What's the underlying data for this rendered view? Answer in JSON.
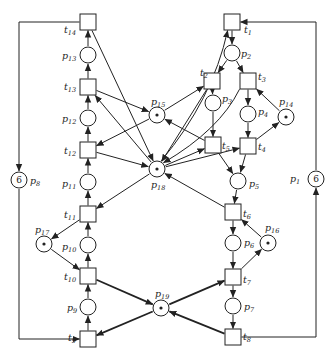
{
  "diagram": {
    "type": "petri-net",
    "colors": {
      "stroke": "#222222",
      "background": "#ffffff"
    },
    "places": [
      {
        "id": "p1",
        "label": "p",
        "sub": "1",
        "x": 316,
        "y": 179,
        "tokens": "6",
        "lx": 290,
        "ly": 182
      },
      {
        "id": "p2",
        "label": "p",
        "sub": "2",
        "x": 232,
        "y": 53,
        "tokens": "",
        "lx": 241,
        "ly": 57
      },
      {
        "id": "p3",
        "label": "p",
        "sub": "3",
        "x": 213,
        "y": 103,
        "tokens": "",
        "lx": 222,
        "ly": 102
      },
      {
        "id": "p4",
        "label": "p",
        "sub": "4",
        "x": 248,
        "y": 114,
        "tokens": "",
        "lx": 258,
        "ly": 115
      },
      {
        "id": "p5",
        "label": "p",
        "sub": "5",
        "x": 238,
        "y": 181,
        "tokens": "",
        "lx": 249,
        "ly": 187
      },
      {
        "id": "p6",
        "label": "p",
        "sub": "6",
        "x": 233,
        "y": 243,
        "tokens": "",
        "lx": 244,
        "ly": 246
      },
      {
        "id": "p7",
        "label": "p",
        "sub": "7",
        "x": 233,
        "y": 306,
        "tokens": "",
        "lx": 244,
        "ly": 310
      },
      {
        "id": "p8",
        "label": "p",
        "sub": "8",
        "x": 19,
        "y": 180,
        "tokens": "6",
        "lx": 30,
        "ly": 184
      },
      {
        "id": "p9",
        "label": "p",
        "sub": "9",
        "x": 88,
        "y": 307,
        "tokens": "",
        "lx": 67,
        "ly": 311
      },
      {
        "id": "p10",
        "label": "p",
        "sub": "10",
        "x": 88,
        "y": 245,
        "tokens": "",
        "lx": 62,
        "ly": 250
      },
      {
        "id": "p11",
        "label": "p",
        "sub": "11",
        "x": 88,
        "y": 182,
        "tokens": "",
        "lx": 62,
        "ly": 187
      },
      {
        "id": "p12",
        "label": "p",
        "sub": "12",
        "x": 88,
        "y": 118,
        "tokens": "",
        "lx": 62,
        "ly": 122
      },
      {
        "id": "p13",
        "label": "p",
        "sub": "13",
        "x": 88,
        "y": 55,
        "tokens": "",
        "lx": 62,
        "ly": 59
      },
      {
        "id": "p14",
        "label": "p",
        "sub": "14",
        "x": 286,
        "y": 117,
        "tokens": "•",
        "lx": 279,
        "ly": 105
      },
      {
        "id": "p15",
        "label": "p",
        "sub": "15",
        "x": 157,
        "y": 115,
        "tokens": "•",
        "lx": 151,
        "ly": 105
      },
      {
        "id": "p16",
        "label": "p",
        "sub": "16",
        "x": 268,
        "y": 243,
        "tokens": "•",
        "lx": 265,
        "ly": 231
      },
      {
        "id": "p17",
        "label": "p",
        "sub": "17",
        "x": 44,
        "y": 244,
        "tokens": "•",
        "lx": 35,
        "ly": 233
      },
      {
        "id": "p18",
        "label": "p",
        "sub": "18",
        "x": 157,
        "y": 169,
        "tokens": "•",
        "lx": 151,
        "ly": 188
      },
      {
        "id": "p19",
        "label": "p",
        "sub": "19",
        "x": 161,
        "y": 308,
        "tokens": "•",
        "lx": 155,
        "ly": 297
      }
    ],
    "transitions": [
      {
        "id": "t1",
        "label": "t",
        "sub": "1",
        "x": 232,
        "y": 22,
        "lx": 244,
        "ly": 33
      },
      {
        "id": "t2",
        "label": "t",
        "sub": "2",
        "x": 212,
        "y": 81,
        "lx": 200,
        "ly": 76
      },
      {
        "id": "t3",
        "label": "t",
        "sub": "3",
        "x": 248,
        "y": 81,
        "lx": 258,
        "ly": 80
      },
      {
        "id": "t4",
        "label": "t",
        "sub": "4",
        "x": 248,
        "y": 146,
        "lx": 258,
        "ly": 150
      },
      {
        "id": "t5",
        "label": "t",
        "sub": "5",
        "x": 213,
        "y": 145,
        "lx": 222,
        "ly": 149
      },
      {
        "id": "t6",
        "label": "t",
        "sub": "6",
        "x": 233,
        "y": 212,
        "lx": 243,
        "ly": 217
      },
      {
        "id": "t7",
        "label": "t",
        "sub": "7",
        "x": 233,
        "y": 277,
        "lx": 243,
        "ly": 283
      },
      {
        "id": "t8",
        "label": "t",
        "sub": "8",
        "x": 233,
        "y": 337,
        "lx": 243,
        "ly": 340
      },
      {
        "id": "t9",
        "label": "t",
        "sub": "9",
        "x": 88,
        "y": 339,
        "lx": 68,
        "ly": 341
      },
      {
        "id": "t10",
        "label": "t",
        "sub": "10",
        "x": 88,
        "y": 276,
        "lx": 64,
        "ly": 280
      },
      {
        "id": "t11",
        "label": "t",
        "sub": "11",
        "x": 88,
        "y": 214,
        "lx": 64,
        "ly": 218
      },
      {
        "id": "t12",
        "label": "t",
        "sub": "12",
        "x": 88,
        "y": 150,
        "lx": 64,
        "ly": 154
      },
      {
        "id": "t13",
        "label": "t",
        "sub": "13",
        "x": 88,
        "y": 87,
        "lx": 64,
        "ly": 90
      },
      {
        "id": "t14",
        "label": "t",
        "sub": "14",
        "x": 88,
        "y": 22,
        "lx": 64,
        "ly": 33
      }
    ],
    "arcs": [
      {
        "from": "t1",
        "to": "p2",
        "points": [
          [
            232,
            22
          ],
          [
            232,
            53
          ]
        ]
      },
      {
        "from": "p2",
        "to": "t2",
        "points": [
          [
            232,
            53
          ],
          [
            212,
            81
          ]
        ]
      },
      {
        "from": "p2",
        "to": "t3",
        "points": [
          [
            232,
            53
          ],
          [
            248,
            81
          ]
        ]
      },
      {
        "from": "t2",
        "to": "p3",
        "points": [
          [
            212,
            81
          ],
          [
            213,
            103
          ]
        ]
      },
      {
        "from": "t3",
        "to": "p4",
        "points": [
          [
            248,
            81
          ],
          [
            248,
            114
          ]
        ]
      },
      {
        "from": "p14",
        "to": "t3",
        "points": [
          [
            286,
            117
          ],
          [
            248,
            81
          ]
        ]
      },
      {
        "from": "p3",
        "to": "t5",
        "points": [
          [
            213,
            103
          ],
          [
            213,
            145
          ]
        ]
      },
      {
        "from": "p4",
        "to": "t4",
        "points": [
          [
            248,
            114
          ],
          [
            248,
            146
          ]
        ]
      },
      {
        "from": "t4",
        "to": "p14",
        "points": [
          [
            248,
            146
          ],
          [
            286,
            117
          ]
        ]
      },
      {
        "from": "t5",
        "to": "p5",
        "points": [
          [
            213,
            145
          ],
          [
            238,
            181
          ]
        ]
      },
      {
        "from": "t4",
        "to": "p5",
        "points": [
          [
            248,
            146
          ],
          [
            238,
            181
          ]
        ]
      },
      {
        "from": "p5",
        "to": "t6",
        "points": [
          [
            238,
            181
          ],
          [
            233,
            212
          ]
        ]
      },
      {
        "from": "t6",
        "to": "p6",
        "points": [
          [
            233,
            212
          ],
          [
            233,
            243
          ]
        ]
      },
      {
        "from": "p16",
        "to": "t6",
        "points": [
          [
            268,
            243
          ],
          [
            233,
            212
          ]
        ]
      },
      {
        "from": "p6",
        "to": "t7",
        "points": [
          [
            233,
            243
          ],
          [
            233,
            277
          ]
        ]
      },
      {
        "from": "t7",
        "to": "p16",
        "points": [
          [
            233,
            277
          ],
          [
            268,
            243
          ]
        ]
      },
      {
        "from": "t7",
        "to": "p7",
        "points": [
          [
            233,
            277
          ],
          [
            233,
            306
          ]
        ]
      },
      {
        "from": "p7",
        "to": "t8",
        "points": [
          [
            233,
            306
          ],
          [
            233,
            337
          ]
        ]
      },
      {
        "from": "t8",
        "to": "p1",
        "points": [
          [
            233,
            337
          ],
          [
            316,
            337
          ],
          [
            316,
            179
          ]
        ]
      },
      {
        "from": "p1",
        "to": "t1",
        "points": [
          [
            316,
            179
          ],
          [
            316,
            22
          ],
          [
            232,
            22
          ]
        ]
      },
      {
        "from": "t14",
        "to": "p8",
        "points": [
          [
            88,
            22
          ],
          [
            19,
            22
          ],
          [
            19,
            180
          ]
        ]
      },
      {
        "from": "p8",
        "to": "t9",
        "points": [
          [
            19,
            180
          ],
          [
            19,
            339
          ],
          [
            88,
            339
          ]
        ]
      },
      {
        "from": "t9",
        "to": "p9",
        "points": [
          [
            88,
            339
          ],
          [
            88,
            307
          ]
        ]
      },
      {
        "from": "p9",
        "to": "t10",
        "points": [
          [
            88,
            307
          ],
          [
            88,
            276
          ]
        ]
      },
      {
        "from": "t10",
        "to": "p10",
        "points": [
          [
            88,
            276
          ],
          [
            88,
            245
          ]
        ]
      },
      {
        "from": "p17",
        "to": "t10",
        "points": [
          [
            44,
            244
          ],
          [
            88,
            276
          ]
        ]
      },
      {
        "from": "p10",
        "to": "t11",
        "points": [
          [
            88,
            245
          ],
          [
            88,
            214
          ]
        ]
      },
      {
        "from": "t11",
        "to": "p17",
        "points": [
          [
            88,
            214
          ],
          [
            44,
            244
          ]
        ]
      },
      {
        "from": "t11",
        "to": "p11",
        "points": [
          [
            88,
            214
          ],
          [
            88,
            182
          ]
        ]
      },
      {
        "from": "p11",
        "to": "t12",
        "points": [
          [
            88,
            182
          ],
          [
            88,
            150
          ]
        ]
      },
      {
        "from": "t12",
        "to": "p12",
        "points": [
          [
            88,
            150
          ],
          [
            88,
            118
          ]
        ]
      },
      {
        "from": "p12",
        "to": "t13",
        "points": [
          [
            88,
            118
          ],
          [
            88,
            87
          ]
        ]
      },
      {
        "from": "t13",
        "to": "p13",
        "points": [
          [
            88,
            87
          ],
          [
            88,
            55
          ]
        ]
      },
      {
        "from": "p13",
        "to": "t14",
        "points": [
          [
            88,
            55
          ],
          [
            88,
            22
          ]
        ]
      },
      {
        "from": "t10",
        "to": "p19",
        "points": [
          [
            88,
            276
          ],
          [
            161,
            308
          ]
        ],
        "bold": true
      },
      {
        "from": "p19",
        "to": "t9",
        "points": [
          [
            161,
            308
          ],
          [
            88,
            339
          ]
        ],
        "bold": true
      },
      {
        "from": "p19",
        "to": "t7",
        "points": [
          [
            161,
            308
          ],
          [
            233,
            277
          ]
        ],
        "bold": true
      },
      {
        "from": "t8",
        "to": "p19",
        "points": [
          [
            233,
            337
          ],
          [
            161,
            308
          ]
        ],
        "bold": true
      },
      {
        "from": "t13",
        "to": "p15",
        "points": [
          [
            88,
            87
          ],
          [
            157,
            115
          ]
        ]
      },
      {
        "from": "p15",
        "to": "t12",
        "points": [
          [
            157,
            115
          ],
          [
            88,
            150
          ]
        ]
      },
      {
        "from": "p15",
        "to": "t2",
        "points": [
          [
            157,
            115
          ],
          [
            212,
            81
          ]
        ]
      },
      {
        "from": "t5",
        "to": "p15",
        "points": [
          [
            213,
            145
          ],
          [
            157,
            115
          ]
        ]
      },
      {
        "from": "t14",
        "to": "p18",
        "points": [
          [
            88,
            22
          ],
          [
            157,
            169
          ]
        ]
      },
      {
        "from": "p18",
        "to": "t13",
        "points": [
          [
            157,
            169
          ],
          [
            88,
            87
          ]
        ]
      },
      {
        "from": "t12",
        "to": "p18",
        "points": [
          [
            88,
            150
          ],
          [
            157,
            169
          ]
        ]
      },
      {
        "from": "p18",
        "to": "t11",
        "points": [
          [
            157,
            169
          ],
          [
            88,
            214
          ]
        ]
      },
      {
        "from": "p18",
        "to": "t1",
        "points": [
          [
            157,
            169
          ],
          [
            232,
            22
          ]
        ],
        "curve": true
      },
      {
        "from": "t2",
        "to": "p18",
        "points": [
          [
            212,
            81
          ],
          [
            157,
            169
          ]
        ]
      },
      {
        "from": "t3",
        "to": "p18",
        "points": [
          [
            248,
            81
          ],
          [
            157,
            169
          ]
        ],
        "curve": true
      },
      {
        "from": "p18",
        "to": "t5",
        "points": [
          [
            157,
            169
          ],
          [
            213,
            145
          ]
        ]
      },
      {
        "from": "p18",
        "to": "t4",
        "points": [
          [
            157,
            169
          ],
          [
            248,
            146
          ]
        ]
      },
      {
        "from": "t6",
        "to": "p18",
        "points": [
          [
            233,
            212
          ],
          [
            157,
            169
          ]
        ]
      }
    ]
  }
}
